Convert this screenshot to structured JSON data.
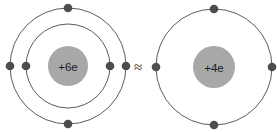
{
  "diagram": {
    "background_color": "#ffffff",
    "relation_symbol": "≈",
    "relation_name": "approximately-equal",
    "shell_color": "#4a4a4a",
    "electron_color": "#4d4d4d",
    "nucleus_color": "#a8a8a8",
    "nucleus_label_color": "#1c1c1c",
    "atoms": [
      {
        "id": "full-atom",
        "name": "carbon-atom-full",
        "center": {
          "x": 68,
          "y": 66
        },
        "nucleus": {
          "label": "+6e",
          "charge_value": 6,
          "radius": 20
        },
        "shells": [
          {
            "name": "inner-shell",
            "index": 1,
            "radius": 42,
            "electron_count": 2,
            "electrons": [
              {
                "name": "electron-inner-left",
                "angle_deg": 180
              },
              {
                "name": "electron-inner-right",
                "angle_deg": 0
              }
            ]
          },
          {
            "name": "outer-shell",
            "index": 2,
            "radius": 58,
            "electron_count": 4,
            "electrons": [
              {
                "name": "electron-outer-top",
                "angle_deg": 270
              },
              {
                "name": "electron-outer-right",
                "angle_deg": 0
              },
              {
                "name": "electron-outer-bottom",
                "angle_deg": 90
              },
              {
                "name": "electron-outer-left",
                "angle_deg": 180
              }
            ]
          }
        ],
        "total_electrons": 6
      },
      {
        "id": "core-atom",
        "name": "carbon-atom-core-approximation",
        "center": {
          "x": 214,
          "y": 67
        },
        "nucleus": {
          "label": "+4e",
          "charge_value": 4,
          "radius": 21
        },
        "shells": [
          {
            "name": "valence-shell",
            "index": 1,
            "radius": 58,
            "electron_count": 4,
            "electrons": [
              {
                "name": "electron-valence-top",
                "angle_deg": 270
              },
              {
                "name": "electron-valence-right",
                "angle_deg": 0
              },
              {
                "name": "electron-valence-bottom",
                "angle_deg": 90
              },
              {
                "name": "electron-valence-left",
                "angle_deg": 180
              }
            ]
          }
        ],
        "total_electrons": 4
      }
    ],
    "relation_position": {
      "x": 138,
      "y": 66
    },
    "electron_radius": 4.3
  }
}
